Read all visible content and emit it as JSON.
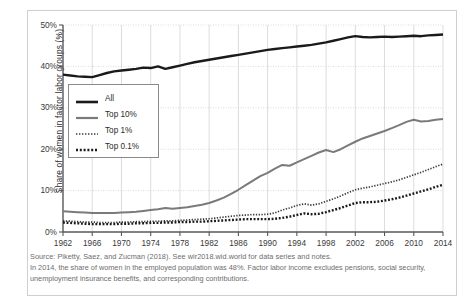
{
  "chart_data": {
    "type": "line",
    "title": "",
    "xlabel": "",
    "ylabel": "Share of women in factor labor groups (%)",
    "xlim": [
      1962,
      2014
    ],
    "ylim": [
      0,
      50
    ],
    "ytick_labels": [
      "0%",
      "10%",
      "20%",
      "30%",
      "40%",
      "50%"
    ],
    "ytick_values": [
      0,
      10,
      20,
      30,
      40,
      50
    ],
    "xtick_labels": [
      "1962",
      "1966",
      "1970",
      "1974",
      "1978",
      "1982",
      "1986",
      "1990",
      "1994",
      "1998",
      "2002",
      "2006",
      "2010",
      "2014"
    ],
    "xtick_values": [
      1962,
      1966,
      1970,
      1974,
      1978,
      1982,
      1986,
      1990,
      1994,
      1998,
      2002,
      2006,
      2010,
      2014
    ],
    "grid": true,
    "legend_position": "inside-left",
    "x": [
      1962,
      1963,
      1964,
      1965,
      1966,
      1967,
      1968,
      1969,
      1970,
      1971,
      1972,
      1973,
      1974,
      1975,
      1976,
      1977,
      1978,
      1979,
      1980,
      1981,
      1982,
      1983,
      1984,
      1985,
      1986,
      1987,
      1988,
      1989,
      1990,
      1991,
      1992,
      1993,
      1994,
      1995,
      1996,
      1997,
      1998,
      1999,
      2000,
      2001,
      2002,
      2003,
      2004,
      2005,
      2006,
      2007,
      2008,
      2009,
      2010,
      2011,
      2012,
      2013,
      2014
    ],
    "series": [
      {
        "name": "All",
        "style": "solid-thick",
        "color": "#1a1a1a",
        "values": [
          38.0,
          37.8,
          37.6,
          37.5,
          37.4,
          37.9,
          38.4,
          38.8,
          39.0,
          39.2,
          39.4,
          39.7,
          39.6,
          40.0,
          39.4,
          39.8,
          40.2,
          40.6,
          41.0,
          41.3,
          41.6,
          41.9,
          42.2,
          42.5,
          42.8,
          43.1,
          43.4,
          43.7,
          44.0,
          44.2,
          44.4,
          44.6,
          44.8,
          45.0,
          45.2,
          45.5,
          45.8,
          46.2,
          46.6,
          47.0,
          47.3,
          47.1,
          47.0,
          47.1,
          47.2,
          47.1,
          47.2,
          47.3,
          47.4,
          47.3,
          47.5,
          47.6,
          47.7
        ]
      },
      {
        "name": "Top 10%",
        "style": "solid-gray",
        "color": "#7a7a7a",
        "values": [
          5.0,
          4.9,
          4.8,
          4.7,
          4.6,
          4.6,
          4.6,
          4.6,
          4.7,
          4.8,
          4.9,
          5.1,
          5.3,
          5.5,
          5.8,
          5.6,
          5.8,
          6.0,
          6.3,
          6.6,
          7.0,
          7.6,
          8.3,
          9.2,
          10.2,
          11.3,
          12.4,
          13.5,
          14.3,
          15.3,
          16.2,
          16.0,
          16.8,
          17.6,
          18.4,
          19.2,
          19.8,
          19.3,
          20.0,
          20.9,
          21.8,
          22.6,
          23.2,
          23.8,
          24.4,
          25.1,
          25.8,
          26.6,
          27.1,
          26.7,
          26.8,
          27.1,
          27.3
        ]
      },
      {
        "name": "Top 1%",
        "style": "dotted-fine",
        "color": "#3a3a3a",
        "values": [
          2.7,
          2.6,
          2.5,
          2.4,
          2.4,
          2.3,
          2.3,
          2.3,
          2.4,
          2.4,
          2.5,
          2.5,
          2.6,
          2.6,
          2.7,
          2.7,
          2.8,
          2.9,
          3.0,
          3.1,
          3.2,
          3.4,
          3.6,
          3.8,
          4.0,
          4.1,
          4.2,
          4.2,
          4.3,
          4.6,
          5.3,
          5.8,
          6.4,
          6.8,
          6.5,
          6.8,
          7.4,
          8.0,
          8.7,
          9.5,
          10.2,
          10.6,
          10.9,
          11.3,
          11.7,
          12.1,
          12.6,
          13.2,
          13.8,
          14.4,
          15.1,
          15.8,
          16.4
        ]
      },
      {
        "name": "Top 0.1%",
        "style": "dotted-thick",
        "color": "#1a1a1a",
        "values": [
          2.3,
          2.2,
          2.1,
          2.0,
          1.9,
          1.9,
          1.9,
          1.9,
          2.0,
          2.0,
          2.1,
          2.1,
          2.2,
          2.2,
          2.3,
          2.3,
          2.4,
          2.4,
          2.5,
          2.5,
          2.6,
          2.7,
          2.8,
          2.9,
          3.0,
          3.1,
          3.1,
          3.1,
          3.1,
          3.2,
          3.4,
          3.7,
          4.1,
          4.5,
          4.3,
          4.4,
          4.8,
          5.3,
          5.8,
          6.4,
          7.0,
          7.2,
          7.2,
          7.3,
          7.6,
          7.9,
          8.3,
          8.8,
          9.3,
          9.8,
          10.3,
          10.9,
          11.4
        ]
      }
    ],
    "legend": [
      "All",
      "Top 10%",
      "Top 1%",
      "Top 0.1%"
    ]
  },
  "notes": {
    "source": "Source: Piketty, Saez, and Zucman (2018). See wir2018.wid.world for data series and notes.",
    "body": "In 2014, the share of women in the employed population was 48%. Factor labor income excludes pensions, social security, unemployment insurance benefits, and corresponding contributions."
  }
}
